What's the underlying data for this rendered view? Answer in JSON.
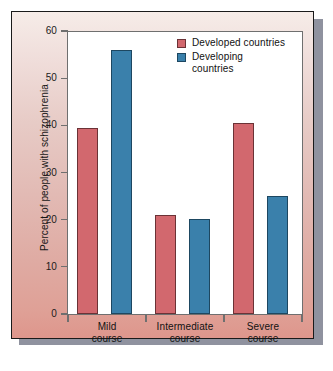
{
  "chart_data": {
    "type": "bar",
    "title": "",
    "xlabel": "",
    "ylabel": "Percent of people with schizophrenia",
    "ylim": [
      0,
      60
    ],
    "yticks": [
      0,
      10,
      20,
      30,
      40,
      50,
      60
    ],
    "ytick_labels": [
      "0",
      "10",
      "20",
      "30",
      "40",
      "50",
      "60"
    ],
    "grid": false,
    "legend_position": "top-right",
    "categories": [
      "Mild course",
      "Intermediate course",
      "Severe course"
    ],
    "category_lines": [
      [
        "Mild",
        "course"
      ],
      [
        "Intermediate",
        "course"
      ],
      [
        "Severe",
        "course"
      ]
    ],
    "series": [
      {
        "name": "Developed countries",
        "legend_lines": [
          "Developed countries"
        ],
        "color": "#d2686e",
        "values": [
          39.5,
          21.0,
          40.5
        ]
      },
      {
        "name": "Developing countries",
        "legend_lines": [
          "Developing",
          "countries"
        ],
        "color": "#3a80ab",
        "values": [
          56.0,
          20.2,
          25.0
        ]
      }
    ]
  },
  "figure": {
    "panel_background_top": "#f6ece8",
    "panel_background_bottom": "#de968c",
    "panel_border": "#1a1a1a",
    "plot_background": "#ffffff",
    "axis_color": "#6f6f6f",
    "shadow_color": "#7b7f8e"
  }
}
